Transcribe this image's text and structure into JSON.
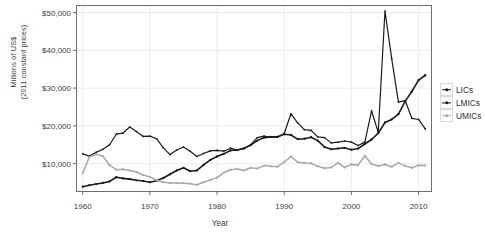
{
  "chart_data": {
    "type": "line",
    "title": "",
    "xlabel": "Year",
    "ylabel": "Millions of US$\n(2011 constant prices)",
    "xlim": [
      1959,
      2012
    ],
    "ylim": [
      2500,
      52000
    ],
    "grid": true,
    "legend_position": "right",
    "xticks": [
      1960,
      1970,
      1980,
      1990,
      2000,
      2010
    ],
    "xtick_labels": [
      "1960",
      "1970",
      "1980",
      "1990",
      "2000",
      "2010"
    ],
    "yticks": [
      10000,
      20000,
      30000,
      40000,
      50000
    ],
    "ytick_labels": [
      "$10,000",
      "$20,000",
      "$30,000",
      "$40,000",
      "$50,000"
    ],
    "x": [
      1960,
      1961,
      1962,
      1963,
      1964,
      1965,
      1966,
      1967,
      1968,
      1969,
      1970,
      1971,
      1972,
      1973,
      1974,
      1975,
      1976,
      1977,
      1978,
      1979,
      1980,
      1981,
      1982,
      1983,
      1984,
      1985,
      1986,
      1987,
      1988,
      1989,
      1990,
      1991,
      1992,
      1993,
      1994,
      1995,
      1996,
      1997,
      1998,
      1999,
      2000,
      2001,
      2002,
      2003,
      2004,
      2005,
      2006,
      2007,
      2008,
      2009,
      2010,
      2011
    ],
    "series": [
      {
        "name": "LICs",
        "color": "#1a1a1a",
        "width": 1.6,
        "marker": "circle",
        "values": [
          3900,
          4300,
          4600,
          4900,
          5300,
          6400,
          6100,
          5900,
          5600,
          5400,
          5100,
          5500,
          6200,
          7200,
          8200,
          8900,
          8000,
          8200,
          9700,
          11000,
          11900,
          12600,
          13500,
          13600,
          14000,
          14900,
          16100,
          16900,
          17100,
          17100,
          17800,
          17600,
          16500,
          16600,
          17000,
          16100,
          14400,
          13800,
          14000,
          14200,
          13700,
          14000,
          15200,
          16400,
          18100,
          20900,
          21700,
          23100,
          26500,
          29100,
          32100,
          33400
        ]
      },
      {
        "name": "LMICs",
        "color": "#1a1a1a",
        "width": 1.2,
        "marker": "circle",
        "values": [
          12600,
          12000,
          13000,
          13800,
          15000,
          17800,
          18100,
          19700,
          18500,
          17200,
          17300,
          16600,
          14200,
          12400,
          13600,
          14400,
          13300,
          11900,
          12700,
          13400,
          13500,
          13300,
          14100,
          13600,
          14100,
          15000,
          16900,
          17300,
          17000,
          17000,
          18000,
          23200,
          20800,
          19000,
          18800,
          17100,
          16900,
          15500,
          15700,
          16000,
          15700,
          14800,
          15700,
          24000,
          18300,
          50400,
          37800,
          26300,
          26700,
          22000,
          21700,
          19200
        ]
      },
      {
        "name": "UMICs",
        "color": "#a8a8a8",
        "width": 1.5,
        "marker": "circle",
        "values": [
          7500,
          11800,
          12500,
          12000,
          9600,
          8400,
          8500,
          8200,
          7800,
          7000,
          6500,
          5600,
          5100,
          4900,
          4900,
          4800,
          4700,
          4400,
          5100,
          5700,
          6300,
          7600,
          8400,
          8600,
          8200,
          8900,
          8700,
          9500,
          9300,
          9200,
          10400,
          11900,
          10400,
          10200,
          10100,
          9300,
          8800,
          9000,
          10200,
          9000,
          9800,
          9600,
          12100,
          9900,
          9400,
          9800,
          9200,
          10200,
          9400,
          8900,
          9600,
          9500
        ]
      }
    ]
  },
  "legend": {
    "items": [
      {
        "label": "LICs"
      },
      {
        "label": "LMICs"
      },
      {
        "label": "UMICs"
      }
    ]
  },
  "panel": {
    "background": "#ffffff",
    "border_color": "#6e6e6e",
    "grid_color": "#ececec"
  }
}
